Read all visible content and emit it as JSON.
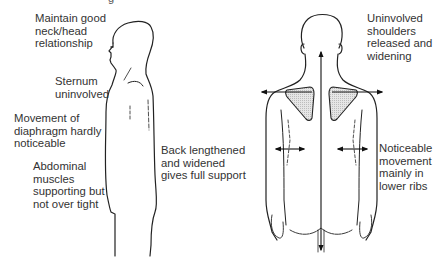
{
  "diagram": {
    "title_fragment": "g",
    "side_view": {
      "labels": [
        "Maintain good\nneck/head\nrelationship",
        "Sternum\nuninvolved",
        "Movement of\ndiaphragm hardly\nnoticeable",
        "Abdominal\nmuscles\nsupporting but\nnot over tight",
        "Back lengthened\nand widened\ngives full support"
      ]
    },
    "back_view": {
      "labels": [
        "Uninvolved\nshoulders\nreleased and\nwidening",
        "Noticeable\nmovement\nmainly in\nlower ribs"
      ],
      "shading_color": "#d9d9d9",
      "line_color": "#222222"
    }
  }
}
